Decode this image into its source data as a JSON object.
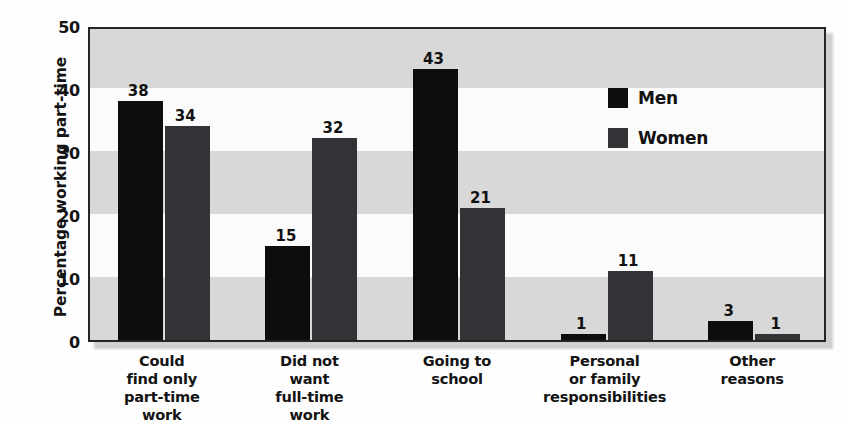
{
  "chart_data": {
    "type": "bar",
    "title": "",
    "xlabel": "",
    "ylabel": "Percentage working part-time",
    "ylim": [
      0,
      50
    ],
    "yticks": [
      0,
      10,
      20,
      30,
      40,
      50
    ],
    "ytick_labels": [
      "0",
      "10",
      "20",
      "30",
      "40",
      "50"
    ],
    "grid": "horizontal alternating shaded bands every 10 units",
    "legend_position": "inside upper right",
    "categories": [
      "Could find only part-time work",
      "Did not want full-time work",
      "Going to school",
      "Personal or family responsibilities",
      "Other reasons"
    ],
    "category_lines": [
      [
        "Could",
        "find only",
        "part-time",
        "work"
      ],
      [
        "Did not",
        "want",
        "full-time",
        "work"
      ],
      [
        "Going to",
        "school"
      ],
      [
        "Personal",
        "or family",
        "responsibilities"
      ],
      [
        "Other",
        "reasons"
      ]
    ],
    "series": [
      {
        "name": "Men",
        "color": "#0d0d0d",
        "values": [
          38,
          15,
          43,
          1,
          3
        ],
        "labels": [
          "38",
          "15",
          "43",
          "1",
          "3"
        ]
      },
      {
        "name": "Women",
        "color": "#333337",
        "values": [
          34,
          32,
          21,
          11,
          1
        ],
        "labels": [
          "34",
          "32",
          "21",
          "11",
          "1"
        ]
      }
    ]
  },
  "legend": {
    "items": [
      {
        "label": "Men",
        "swatch": "men-swatch",
        "color": "#0d0d0d"
      },
      {
        "label": "Women",
        "swatch": "women-swatch",
        "color": "#333337"
      }
    ]
  },
  "colors": {
    "men": "#0d0d0d",
    "women": "#333337",
    "band_dark": "#d8d8d8",
    "band_light": "#fbfbfb",
    "axis": "#262626",
    "text": "#141414"
  }
}
